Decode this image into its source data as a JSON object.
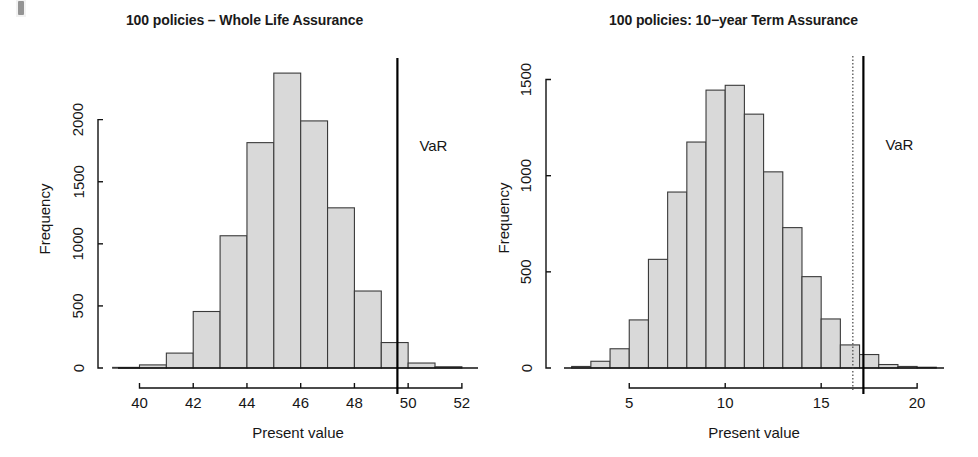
{
  "figure": {
    "width": 978,
    "height": 457,
    "background": "#ffffff",
    "bar_fill": "#d9d9d9",
    "bar_stroke": "#3a3a3a",
    "axis_color": "#111111",
    "scan_artifact": "top-left-scan-mark"
  },
  "panels": [
    {
      "id": "left",
      "var_label": "VaR"
    },
    {
      "id": "right",
      "var_label": "VaR"
    }
  ],
  "chart_data": [
    {
      "type": "bar",
      "subtype": "histogram",
      "title": "100 policies – Whole Life Assurance",
      "xlabel": "Present value",
      "ylabel": "Frequency",
      "xlim": [
        39.2,
        52.6
      ],
      "ylim": [
        0,
        2400
      ],
      "xticks": [
        40,
        42,
        44,
        46,
        48,
        50,
        52
      ],
      "xtick_labels": [
        "40",
        "42",
        "44",
        "46",
        "48",
        "50",
        "52"
      ],
      "yticks": [
        0,
        500,
        1000,
        1500,
        2000
      ],
      "ytick_labels": [
        "0",
        "500",
        "1000",
        "1500",
        "2000"
      ],
      "grid": false,
      "legend": false,
      "bin_width": 1,
      "bin_edges": [
        39,
        40,
        41,
        42,
        43,
        44,
        45,
        46,
        47,
        48,
        49,
        50,
        51,
        52
      ],
      "bin_centers": [
        39.5,
        40.5,
        41.5,
        42.5,
        43.5,
        44.5,
        45.5,
        46.5,
        47.5,
        48.5,
        49.5,
        50.5,
        51.5
      ],
      "values": [
        5,
        25,
        120,
        455,
        1065,
        1815,
        2375,
        1990,
        1290,
        620,
        205,
        40,
        10
      ],
      "annotations": [
        {
          "type": "vline",
          "label": "VaR",
          "x": 49.6,
          "style": "solid"
        }
      ]
    },
    {
      "type": "bar",
      "subtype": "histogram",
      "title": "100 policies: 10−year Term Assurance",
      "xlabel": "Present value",
      "ylabel": "Frequency",
      "xlim": [
        1.6,
        21.4
      ],
      "ylim": [
        0,
        1560
      ],
      "xticks": [
        5,
        10,
        15,
        20
      ],
      "xtick_labels": [
        "5",
        "10",
        "15",
        "20"
      ],
      "yticks": [
        0,
        500,
        1000,
        1500
      ],
      "ytick_labels": [
        "0",
        "500",
        "1000",
        "1500"
      ],
      "grid": false,
      "legend": false,
      "bin_width": 1,
      "bin_edges": [
        2,
        3,
        4,
        5,
        6,
        7,
        8,
        9,
        10,
        11,
        12,
        13,
        14,
        15,
        16,
        17,
        18,
        19,
        20,
        21
      ],
      "bin_centers": [
        2.5,
        3.5,
        4.5,
        5.5,
        6.5,
        7.5,
        8.5,
        9.5,
        10.5,
        11.5,
        12.5,
        13.5,
        14.5,
        15.5,
        16.5,
        17.5,
        18.5,
        19.5,
        20.5
      ],
      "values": [
        8,
        35,
        100,
        250,
        565,
        915,
        1175,
        1445,
        1470,
        1320,
        1020,
        730,
        475,
        255,
        120,
        70,
        18,
        8,
        4
      ],
      "annotations": [
        {
          "type": "vline",
          "label": "",
          "x": 16.65,
          "style": "dotted"
        },
        {
          "type": "vline",
          "label": "VaR",
          "x": 17.2,
          "style": "solid"
        }
      ]
    }
  ]
}
